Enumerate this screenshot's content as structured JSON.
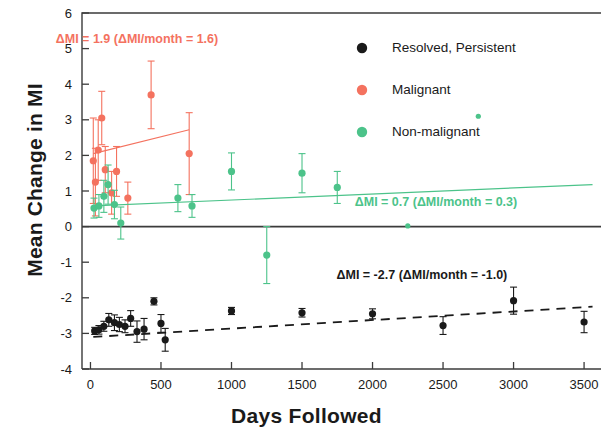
{
  "chart_data": {
    "type": "scatter",
    "title": "",
    "xlabel": "Days Followed",
    "ylabel": "Mean Change in MI",
    "xlim": [
      -60,
      3620
    ],
    "ylim": [
      -4,
      6
    ],
    "xticks": [
      0,
      500,
      1000,
      1500,
      2000,
      2500,
      3000,
      3500
    ],
    "xtick_labels": [
      "0",
      "500",
      "1000",
      "1500",
      "2000",
      "2500",
      "3000",
      "3500"
    ],
    "yticks": [
      6,
      5,
      4,
      3,
      2,
      1,
      0,
      -1,
      -2,
      -3,
      -4
    ],
    "ytick_labels": [
      "6",
      "5",
      "4",
      "3",
      "2",
      "1",
      "0",
      "-1",
      "-2",
      "-3",
      "-4"
    ],
    "grid": false,
    "zero_line": true,
    "error_bars": "vertical",
    "legend_position": "top-right",
    "series": [
      {
        "name": "Resolved, Persistent",
        "color": "#1a1a1a",
        "marker": "circle",
        "trend_style": "dashed",
        "points": [
          {
            "x": 30,
            "y": -2.93,
            "err": 0.1
          },
          {
            "x": 60,
            "y": -2.9,
            "err": 0.12
          },
          {
            "x": 95,
            "y": -2.8,
            "err": 0.14
          },
          {
            "x": 130,
            "y": -2.62,
            "err": 0.18
          },
          {
            "x": 170,
            "y": -2.7,
            "err": 0.22
          },
          {
            "x": 205,
            "y": -2.75,
            "err": 0.2
          },
          {
            "x": 245,
            "y": -2.8,
            "err": 0.18
          },
          {
            "x": 285,
            "y": -2.58,
            "err": 0.22
          },
          {
            "x": 330,
            "y": -2.95,
            "err": 0.3
          },
          {
            "x": 380,
            "y": -2.88,
            "err": 0.3
          },
          {
            "x": 450,
            "y": -2.1,
            "err": 0.1
          },
          {
            "x": 500,
            "y": -2.72,
            "err": 0.25
          },
          {
            "x": 530,
            "y": -3.18,
            "err": 0.32
          },
          {
            "x": 1000,
            "y": -2.37,
            "err": 0.1
          },
          {
            "x": 1500,
            "y": -2.42,
            "err": 0.12
          },
          {
            "x": 2000,
            "y": -2.45,
            "err": 0.14
          },
          {
            "x": 2500,
            "y": -2.78,
            "err": 0.25
          },
          {
            "x": 3000,
            "y": -2.08,
            "err": 0.38
          },
          {
            "x": 3500,
            "y": -2.68,
            "err": 0.3
          }
        ],
        "trend_from": {
          "x": 20,
          "y": -3.1
        },
        "trend_to": {
          "x": 3560,
          "y": -2.25
        },
        "annotation": "ΔMI = -2.7 (ΔMI/month = -1.0)",
        "annotation_x": 2350,
        "annotation_y": -1.35
      },
      {
        "name": "Malignant",
        "color": "#f4725f",
        "marker": "circle",
        "trend_style": "solid",
        "points": [
          {
            "x": 20,
            "y": 1.85,
            "err": 1.2
          },
          {
            "x": 35,
            "y": 1.25,
            "err": 0.95
          },
          {
            "x": 55,
            "y": 2.15,
            "err": 0.85
          },
          {
            "x": 80,
            "y": 3.05,
            "err": 0.75
          },
          {
            "x": 105,
            "y": 1.6,
            "err": 0.65
          },
          {
            "x": 150,
            "y": 0.95,
            "err": 0.6
          },
          {
            "x": 185,
            "y": 1.55,
            "err": 0.7
          },
          {
            "x": 265,
            "y": 0.8,
            "err": 0.45
          },
          {
            "x": 430,
            "y": 3.7,
            "err": 0.95
          },
          {
            "x": 700,
            "y": 2.05,
            "err": 1.15
          }
        ],
        "trend_from": {
          "x": 20,
          "y": 2.05
        },
        "trend_to": {
          "x": 700,
          "y": 2.72
        },
        "annotation": "ΔMI = 1.9 (ΔMI/month = 1.6)",
        "annotation_x": 330,
        "annotation_y": 5.28
      },
      {
        "name": "Non-malignant",
        "color": "#4cc38a",
        "marker": "circle",
        "trend_style": "solid",
        "points": [
          {
            "x": 25,
            "y": 0.52,
            "err": 0.28
          },
          {
            "x": 60,
            "y": 0.58,
            "err": 0.32
          },
          {
            "x": 95,
            "y": 0.85,
            "err": 0.45
          },
          {
            "x": 125,
            "y": 1.18,
            "err": 0.55
          },
          {
            "x": 170,
            "y": 0.62,
            "err": 0.4
          },
          {
            "x": 215,
            "y": 0.1,
            "err": 0.45
          },
          {
            "x": 620,
            "y": 0.8,
            "err": 0.38
          },
          {
            "x": 720,
            "y": 0.58,
            "err": 0.32
          },
          {
            "x": 1000,
            "y": 1.55,
            "err": 0.52
          },
          {
            "x": 1250,
            "y": -0.8,
            "err": 0.8
          },
          {
            "x": 1500,
            "y": 1.5,
            "err": 0.55
          },
          {
            "x": 1750,
            "y": 1.1,
            "err": 0.45
          },
          {
            "x": 2250,
            "y": 0.02,
            "err": 0.0
          },
          {
            "x": 2750,
            "y": 3.1,
            "err": 0.0
          }
        ],
        "trend_from": {
          "x": 20,
          "y": 0.58
        },
        "trend_to": {
          "x": 3560,
          "y": 1.18
        },
        "annotation": "ΔMI = 0.7 (ΔMI/month = 0.3)",
        "annotation_x": 2450,
        "annotation_y": 0.68
      }
    ],
    "legend": [
      {
        "label": "Resolved, Persistent",
        "color": "#1a1a1a"
      },
      {
        "label": "Malignant",
        "color": "#f4725f"
      },
      {
        "label": "Non-malignant",
        "color": "#4cc38a"
      }
    ]
  }
}
